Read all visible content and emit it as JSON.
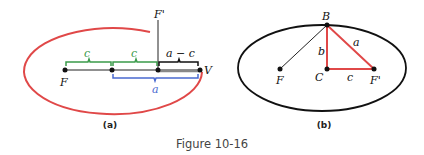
{
  "figure": {
    "caption": "Figure 10-16",
    "panel_a": {
      "sublabel": "(a)",
      "point_labels": {
        "F": "F",
        "F_prime": "F'",
        "V": "V"
      },
      "brace_labels": {
        "c1": "c",
        "c2": "c",
        "a_minus_c": "a − c",
        "a": "a"
      },
      "colors": {
        "ellipse": "#e04848",
        "c_brace": "#3a9a4a",
        "a_brace": "#4a6ad0",
        "amc_brace": "#111111"
      }
    },
    "panel_b": {
      "sublabel": "(b)",
      "point_labels": {
        "B": "B",
        "C": "C",
        "F": "F",
        "F_prime": "F'"
      },
      "segment_labels": {
        "a": "a",
        "b": "b",
        "c": "c"
      },
      "colors": {
        "ellipse": "#111111",
        "triangle": "#e04848"
      }
    }
  }
}
